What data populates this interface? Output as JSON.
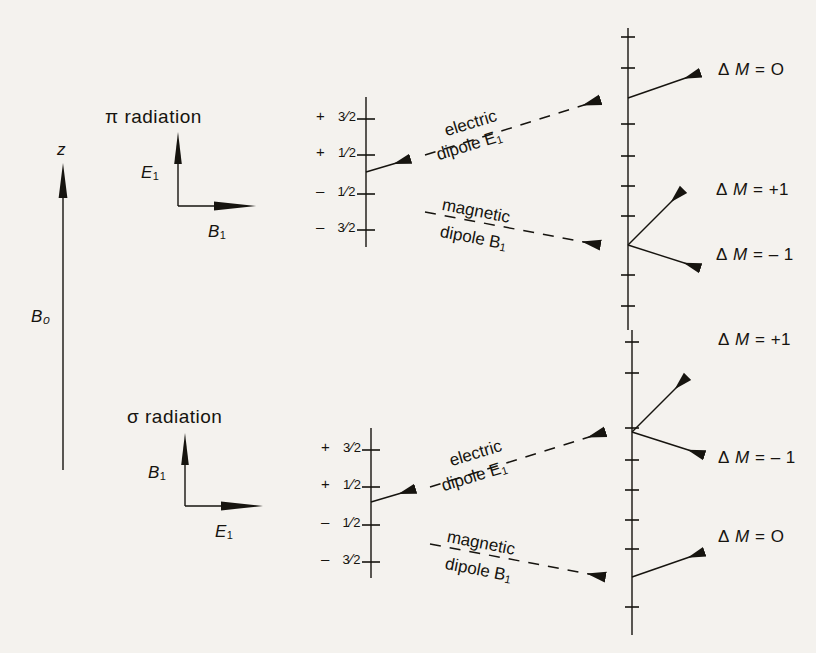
{
  "figure": {
    "background_color": "#f4f2ee",
    "ink_color": "#16140f"
  },
  "field_axis": {
    "tip_label": "z",
    "field_label": "B₀",
    "name": "static-magnetic-field-axis"
  },
  "panels": [
    {
      "id": "pi",
      "heading": "π radiation",
      "vertical_vector_label": "E",
      "vertical_vector_sub": "1",
      "horizontal_vector_label": "B",
      "horizontal_vector_sub": "1",
      "levels": [
        {
          "sign": "+",
          "num": "3",
          "den": "2"
        },
        {
          "sign": "+",
          "num": "1",
          "den": "2"
        },
        {
          "sign": "–",
          "num": "1",
          "den": "2"
        },
        {
          "sign": "–",
          "num": "3",
          "den": "2"
        }
      ],
      "transitions": [
        {
          "kind": "electric",
          "line1": "electric",
          "line2": "dipole E",
          "sub": "1"
        },
        {
          "kind": "magnetic",
          "line1": "magnetic",
          "line2": "dipole B",
          "sub": "1"
        }
      ],
      "outcomes": [
        {
          "label": "Δ M = O",
          "delta": "Δ",
          "m": "M",
          "eq": "=",
          "value": "O"
        },
        {
          "label": "Δ M = +1",
          "delta": "Δ",
          "m": "M",
          "eq": "=",
          "value": "+1"
        },
        {
          "label": "Δ M = – 1",
          "delta": "Δ",
          "m": "M",
          "eq": "=",
          "value": "– 1"
        }
      ]
    },
    {
      "id": "sigma",
      "heading": "σ radiation",
      "vertical_vector_label": "B",
      "vertical_vector_sub": "1",
      "horizontal_vector_label": "E",
      "horizontal_vector_sub": "1",
      "levels": [
        {
          "sign": "+",
          "num": "3",
          "den": "2"
        },
        {
          "sign": "+",
          "num": "1",
          "den": "2"
        },
        {
          "sign": "–",
          "num": "1",
          "den": "2"
        },
        {
          "sign": "–",
          "num": "3",
          "den": "2"
        }
      ],
      "transitions": [
        {
          "kind": "electric",
          "line1": "electric",
          "line2": "dipole E",
          "sub": "1"
        },
        {
          "kind": "magnetic",
          "line1": "magnetic",
          "line2": "dipole B",
          "sub": "1"
        }
      ],
      "outcomes": [
        {
          "label": "Δ M = +1",
          "delta": "Δ",
          "m": "M",
          "eq": "=",
          "value": "+1"
        },
        {
          "label": "Δ M = – 1",
          "delta": "Δ",
          "m": "M",
          "eq": "=",
          "value": "– 1"
        },
        {
          "label": "Δ M = O",
          "delta": "Δ",
          "m": "M",
          "eq": "=",
          "value": "O"
        }
      ]
    }
  ]
}
